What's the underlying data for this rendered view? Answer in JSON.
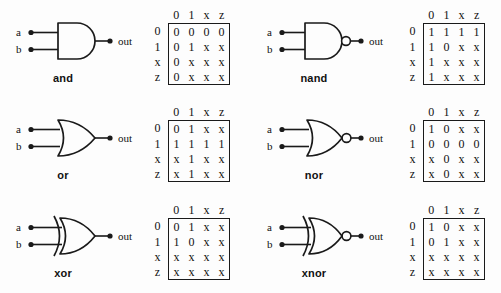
{
  "figure": {
    "axis_headers": [
      "0",
      "1",
      "x",
      "z"
    ],
    "row_headers": [
      "0",
      "1",
      "x",
      "z"
    ],
    "input_labels": [
      "a",
      "b"
    ],
    "output_label": "out",
    "line_color": "#1a1a1a",
    "background": "#fdfdfd"
  },
  "gates": [
    {
      "id": "and",
      "name": "and",
      "label": "and",
      "shape": "and-gate-icon",
      "inverted": false,
      "inputs": [
        "a",
        "b"
      ],
      "output": "out",
      "columns": [
        "0",
        "1",
        "x",
        "z"
      ],
      "rows": [
        "0",
        "1",
        "x",
        "z"
      ],
      "table": [
        [
          "0",
          "0",
          "0",
          "0"
        ],
        [
          "0",
          "1",
          "x",
          "x"
        ],
        [
          "0",
          "x",
          "x",
          "x"
        ],
        [
          "0",
          "x",
          "x",
          "x"
        ]
      ]
    },
    {
      "id": "nand",
      "name": "nand",
      "label": "nand",
      "shape": "nand-gate-icon",
      "inverted": true,
      "inputs": [
        "a",
        "b"
      ],
      "output": "out",
      "columns": [
        "0",
        "1",
        "x",
        "z"
      ],
      "rows": [
        "0",
        "1",
        "x",
        "z"
      ],
      "table": [
        [
          "1",
          "1",
          "1",
          "1"
        ],
        [
          "1",
          "0",
          "x",
          "x"
        ],
        [
          "1",
          "x",
          "x",
          "x"
        ],
        [
          "1",
          "x",
          "x",
          "x"
        ]
      ]
    },
    {
      "id": "or",
      "name": "or",
      "label": "or",
      "shape": "or-gate-icon",
      "inverted": false,
      "inputs": [
        "a",
        "b"
      ],
      "output": "out",
      "columns": [
        "0",
        "1",
        "x",
        "z"
      ],
      "rows": [
        "0",
        "1",
        "x",
        "z"
      ],
      "table": [
        [
          "0",
          "1",
          "x",
          "x"
        ],
        [
          "1",
          "1",
          "1",
          "1"
        ],
        [
          "x",
          "1",
          "x",
          "x"
        ],
        [
          "x",
          "1",
          "x",
          "x"
        ]
      ]
    },
    {
      "id": "nor",
      "name": "nor",
      "label": "nor",
      "shape": "nor-gate-icon",
      "inverted": true,
      "inputs": [
        "a",
        "b"
      ],
      "output": "out",
      "columns": [
        "0",
        "1",
        "x",
        "z"
      ],
      "rows": [
        "0",
        "1",
        "x",
        "z"
      ],
      "table": [
        [
          "1",
          "0",
          "x",
          "x"
        ],
        [
          "0",
          "0",
          "0",
          "0"
        ],
        [
          "x",
          "0",
          "x",
          "x"
        ],
        [
          "x",
          "0",
          "x",
          "x"
        ]
      ]
    },
    {
      "id": "xor",
      "name": "xor",
      "label": "xor",
      "shape": "xor-gate-icon",
      "inverted": false,
      "inputs": [
        "a",
        "b"
      ],
      "output": "out",
      "columns": [
        "0",
        "1",
        "x",
        "z"
      ],
      "rows": [
        "0",
        "1",
        "x",
        "z"
      ],
      "table": [
        [
          "0",
          "1",
          "x",
          "x"
        ],
        [
          "1",
          "0",
          "x",
          "x"
        ],
        [
          "x",
          "x",
          "x",
          "x"
        ],
        [
          "x",
          "x",
          "x",
          "x"
        ]
      ]
    },
    {
      "id": "xnor",
      "name": "xnor",
      "label": "xnor",
      "shape": "xnor-gate-icon",
      "inverted": true,
      "inputs": [
        "a",
        "b"
      ],
      "output": "out",
      "columns": [
        "0",
        "1",
        "x",
        "z"
      ],
      "rows": [
        "0",
        "1",
        "x",
        "z"
      ],
      "table": [
        [
          "1",
          "0",
          "x",
          "x"
        ],
        [
          "0",
          "1",
          "x",
          "x"
        ],
        [
          "x",
          "x",
          "x",
          "x"
        ],
        [
          "x",
          "x",
          "x",
          "x"
        ]
      ]
    }
  ]
}
